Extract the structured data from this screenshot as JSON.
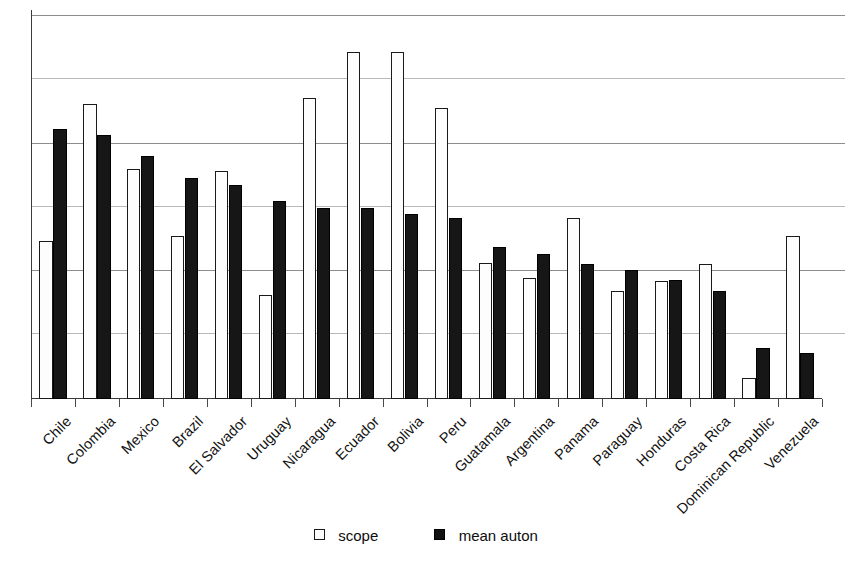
{
  "chart_data": {
    "type": "bar",
    "title": "",
    "subtitle": "",
    "xlabel": "",
    "ylabel": "",
    "ylim": [
      0,
      6.1
    ],
    "grid": true,
    "gridlines": [
      1,
      2,
      3,
      4,
      5,
      6
    ],
    "y_tick_labels": [],
    "legend_position": "bottom-center",
    "categories": [
      "Chile",
      "Colombia",
      "Mexico",
      "Brazil",
      "El Salvador",
      "Uruguay",
      "Nicaragua",
      "Ecuador",
      "Bolivia",
      "Peru",
      "Guatamala",
      "Argentina",
      "Panama",
      "Paraguay",
      "Honduras",
      "Costa Rica",
      "Dominican Republic",
      "Venezuela"
    ],
    "series": [
      {
        "name": "scope",
        "color": "#ffffff",
        "edge_color": "#1a1a1a",
        "values": [
          2.48,
          4.62,
          3.61,
          2.56,
          3.57,
          1.63,
          4.72,
          5.45,
          5.45,
          4.56,
          2.13,
          1.9,
          2.84,
          1.69,
          1.85,
          2.12,
          0.33,
          2.56
        ]
      },
      {
        "name": "mean auton",
        "color": "#161616",
        "edge_color": "#000000",
        "values": [
          4.23,
          4.14,
          3.81,
          3.46,
          3.35,
          3.1,
          2.99,
          2.99,
          2.91,
          2.84,
          2.38,
          2.27,
          2.12,
          2.02,
          1.86,
          1.69,
          0.8,
          0.72
        ]
      }
    ]
  },
  "legend": {
    "items": [
      {
        "label": "scope",
        "style": "scope"
      },
      {
        "label": "mean auton",
        "style": "auton"
      }
    ]
  }
}
